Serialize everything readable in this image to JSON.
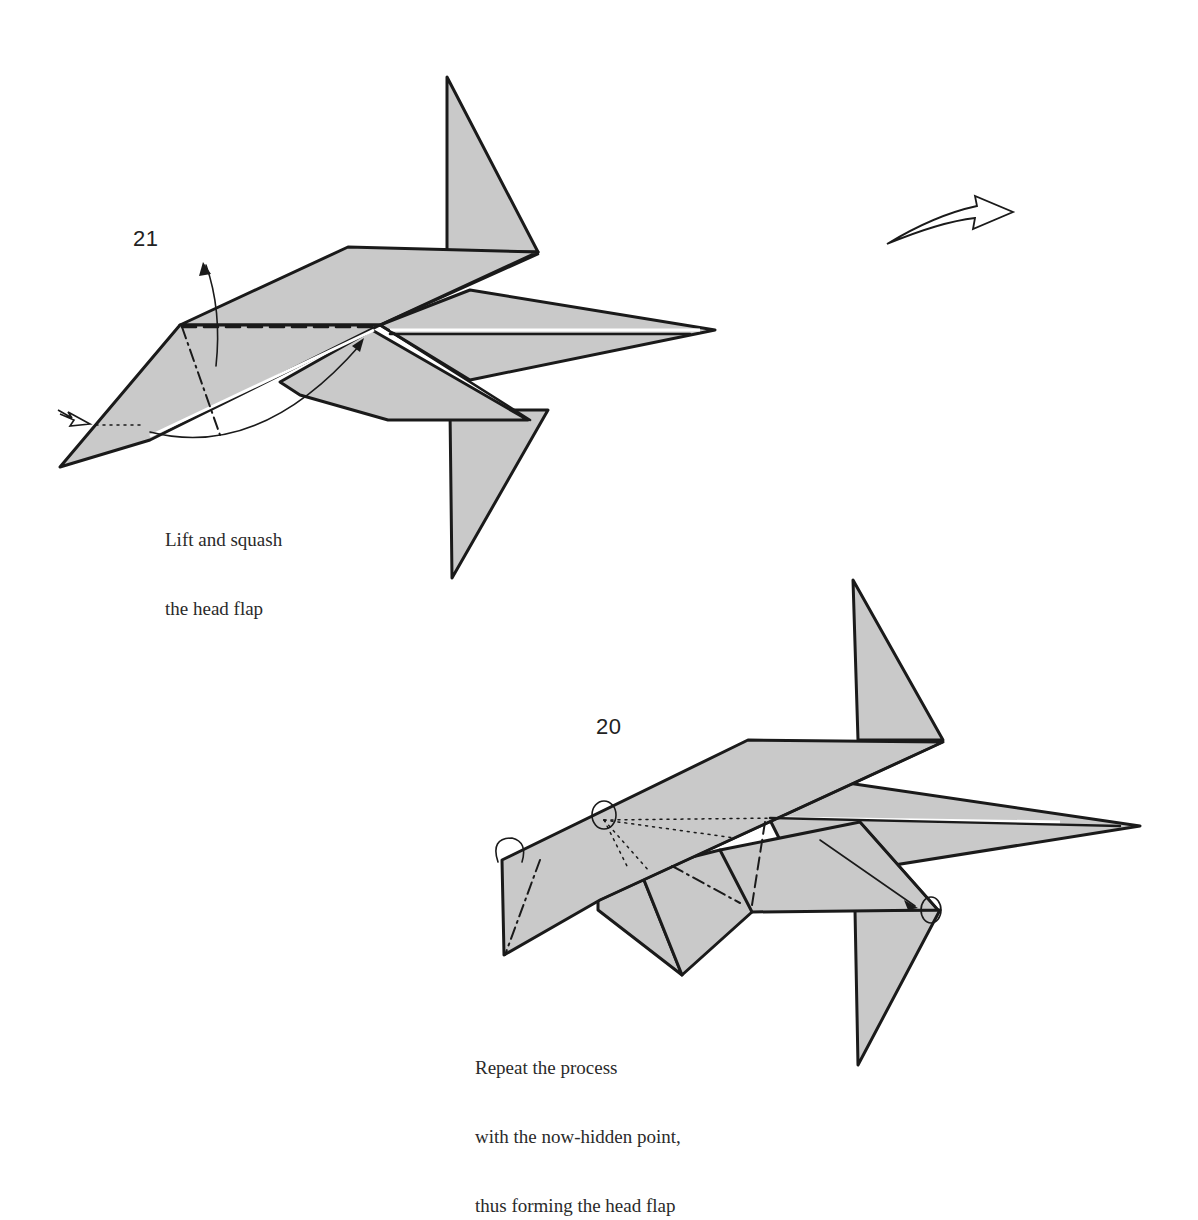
{
  "diagram": {
    "type": "origami-instruction-diagram",
    "colors": {
      "paper_fill": "#c9c9c9",
      "line": "#1a1a1a",
      "background": "#ffffff"
    },
    "steps": [
      {
        "number": "21",
        "caption_lines": [
          "Lift and squash",
          "the head flap"
        ],
        "symbols": [
          "push-arrow",
          "lift-arrow",
          "swing-arrow",
          "valley-fold-line",
          "mountain-fold-line",
          "hidden-line"
        ]
      },
      {
        "number": "20",
        "caption_lines": [
          "Repeat the process",
          "with the now-hidden point,",
          "thus forming the head flap"
        ],
        "symbols": [
          "turn-over-arrow",
          "reference-circle",
          "reference-circle",
          "mountain-fold-line",
          "hidden-lines",
          "move-arrow"
        ]
      }
    ],
    "flow_arrow": {
      "direction": "right",
      "icon": "hollow-arrow-icon"
    }
  }
}
